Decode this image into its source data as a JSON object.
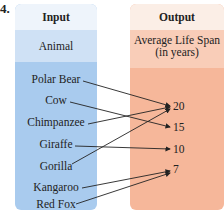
{
  "problem_number": "4.",
  "input": {
    "header": "Input",
    "subheader": "Animal",
    "items": [
      "Polar Bear",
      "Cow",
      "Chimpanzee",
      "Giraffe",
      "Gorilla",
      "Kangaroo",
      "Red Fox"
    ]
  },
  "output": {
    "header": "Output",
    "subheader_line1": "Average Life Span",
    "subheader_line2": "(in years)",
    "items": [
      "20",
      "15",
      "10",
      "7"
    ]
  },
  "mappings": [
    {
      "from": "Polar Bear",
      "to": "20"
    },
    {
      "from": "Cow",
      "to": "15"
    },
    {
      "from": "Chimpanzee",
      "to": "20"
    },
    {
      "from": "Giraffe",
      "to": "10"
    },
    {
      "from": "Gorilla",
      "to": "20"
    },
    {
      "from": "Kangaroo",
      "to": "7"
    },
    {
      "from": "Red Fox",
      "to": "7"
    }
  ],
  "colors": {
    "input_bg": "#a9cbee",
    "output_bg": "#f6b79a"
  }
}
